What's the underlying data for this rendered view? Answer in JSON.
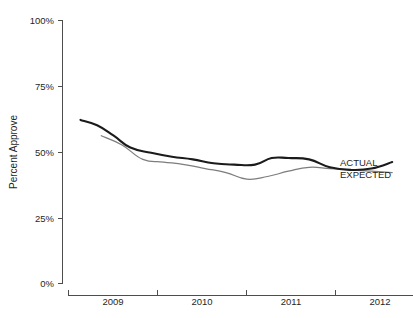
{
  "chart_data": {
    "type": "line",
    "title": "",
    "xlabel": "",
    "ylabel": "Percent Approve",
    "ylim": [
      0,
      100
    ],
    "xlim": [
      2008.6,
      2012.75
    ],
    "grid": false,
    "legend_position": "right-inline",
    "yticks": [
      "0%",
      "25%",
      "50%",
      "75%",
      "100%"
    ],
    "ytick_values": [
      0,
      25,
      50,
      75,
      100
    ],
    "xticks": [
      "2009",
      "2010",
      "2011",
      "2012"
    ],
    "xtick_values": [
      2009,
      2010,
      2011,
      2012
    ],
    "series": [
      {
        "name": "ACTUAL",
        "color": "#1b1b1b",
        "x": [
          2008.75,
          2008.95,
          2009.15,
          2009.35,
          2009.6,
          2009.85,
          2010.1,
          2010.35,
          2010.6,
          2010.85,
          2011.05,
          2011.25,
          2011.5,
          2011.75,
          2012.0,
          2012.25,
          2012.5
        ],
        "values": [
          62.0,
          60.0,
          56.0,
          51.5,
          49.5,
          48.0,
          47.0,
          45.5,
          45.0,
          45.0,
          47.5,
          47.5,
          47.0,
          44.0,
          43.0,
          43.5,
          46.0
        ]
      },
      {
        "name": "EXPECTED",
        "color": "#7d7d7d",
        "x": [
          2009.0,
          2009.25,
          2009.5,
          2009.75,
          2010.0,
          2010.25,
          2010.5,
          2010.75,
          2011.0,
          2011.25,
          2011.5,
          2011.75,
          2012.0,
          2012.25,
          2012.5
        ],
        "values": [
          56.0,
          52.5,
          47.0,
          46.0,
          45.0,
          43.5,
          42.0,
          39.5,
          40.5,
          42.5,
          44.0,
          43.5,
          43.0,
          42.5,
          42.0
        ]
      }
    ],
    "annotations": [
      {
        "text": "ACTUAL",
        "series": "ACTUAL"
      },
      {
        "text": "EXPECTED",
        "series": "EXPECTED"
      }
    ]
  },
  "axes": {
    "y_title": "Percent Approve",
    "y_labels": {
      "t0": "0%",
      "t25": "25%",
      "t50": "50%",
      "t75": "75%",
      "t100": "100%"
    },
    "x_labels": {
      "y2009": "2009",
      "y2010": "2010",
      "y2011": "2011",
      "y2012": "2012"
    }
  },
  "legend": {
    "actual": "ACTUAL",
    "expected": "EXPECTED"
  },
  "colors": {
    "actual": "#1b1b1b",
    "expected": "#7d7d7d",
    "axis": "#4d4d4d",
    "background": "#ffffff"
  }
}
